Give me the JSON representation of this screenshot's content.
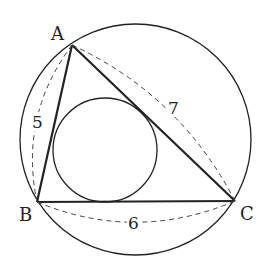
{
  "figure": {
    "colors": {
      "stroke": "#222222",
      "background": "#ffffff"
    },
    "vertices": [
      {
        "name": "A",
        "x": 72,
        "y": 45,
        "label_x": 51,
        "label_y": 40
      },
      {
        "name": "B",
        "x": 37,
        "y": 202,
        "label_x": 19,
        "label_y": 221
      },
      {
        "name": "C",
        "x": 235,
        "y": 201,
        "label_x": 240,
        "label_y": 220
      }
    ],
    "side_lengths": [
      {
        "side": "AB",
        "label": "5",
        "x": 38,
        "y": 127
      },
      {
        "side": "AC",
        "label": "7",
        "x": 174,
        "y": 113
      },
      {
        "side": "BC",
        "label": "6",
        "x": 134,
        "y": 228
      }
    ],
    "circumcircle": {
      "cx": 135.5,
      "cy": 139.5,
      "r": 115.5
    },
    "incircle": {
      "cx": 105,
      "cy": 150,
      "r": 52
    }
  }
}
